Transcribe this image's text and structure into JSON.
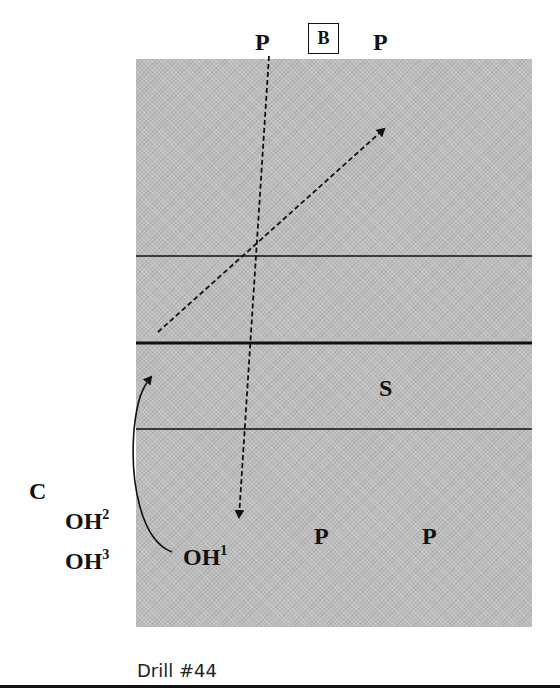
{
  "diagram": {
    "title_fragment": "",
    "caption": "Drill #44",
    "court": {
      "fill_color": "#bcbcbc",
      "line_color": "#111111",
      "lines": [
        {
          "name": "attack-line-far",
          "weight": "thin"
        },
        {
          "name": "net",
          "weight": "thick"
        },
        {
          "name": "attack-line-near",
          "weight": "thin"
        }
      ]
    },
    "players": {
      "top_left_p": "P",
      "ball_box": "B",
      "top_right_p": "P",
      "setter": "S",
      "coach": "C",
      "oh2": {
        "base": "OH",
        "sup": "2"
      },
      "oh3": {
        "base": "OH",
        "sup": "3"
      },
      "oh1": {
        "base": "OH",
        "sup": "1"
      },
      "bottom_mid_p": "P",
      "bottom_right_p": "P"
    },
    "arrows": [
      {
        "name": "pass-arrow-p-to-oh1",
        "style": "dashed",
        "from": "top P",
        "to": "OH1 area"
      },
      {
        "name": "attack-arrow-diagonal",
        "style": "dashed",
        "from": "left near net",
        "to": "far deep right"
      },
      {
        "name": "rotation-arrow-oh1",
        "style": "solid-curved",
        "from": "OH1",
        "to": "left front near net"
      }
    ]
  }
}
